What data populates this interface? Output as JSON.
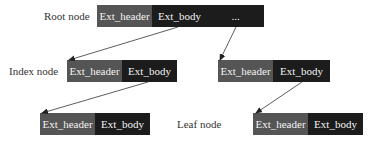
{
  "diagram": {
    "labels": {
      "root": "Root node",
      "index": "Index node",
      "leaf": "Leaf node"
    },
    "colors": {
      "header_fill": "#555555",
      "body_fill": "#1c1c1c",
      "text_in_box": "#f2f2f2",
      "label_text": "#333333",
      "arrow": "#333333"
    },
    "nodes": {
      "root": {
        "header": "Ext_header",
        "body": "Ext_body",
        "more": "..."
      },
      "index_left": {
        "header": "Ext_header",
        "body": "Ext_body"
      },
      "index_right": {
        "header": "Ext_header",
        "body": "Ext_body"
      },
      "leaf_left": {
        "header": "Ext_header",
        "body": "Ext_body"
      },
      "leaf_right": {
        "header": "Ext_header",
        "body": "Ext_body"
      }
    },
    "edges": [
      {
        "from": "root.body",
        "to": "index_left"
      },
      {
        "from": "root.more",
        "to": "index_right"
      },
      {
        "from": "index_left.body",
        "to": "leaf_left"
      },
      {
        "from": "index_right.body",
        "to": "leaf_right"
      }
    ]
  }
}
